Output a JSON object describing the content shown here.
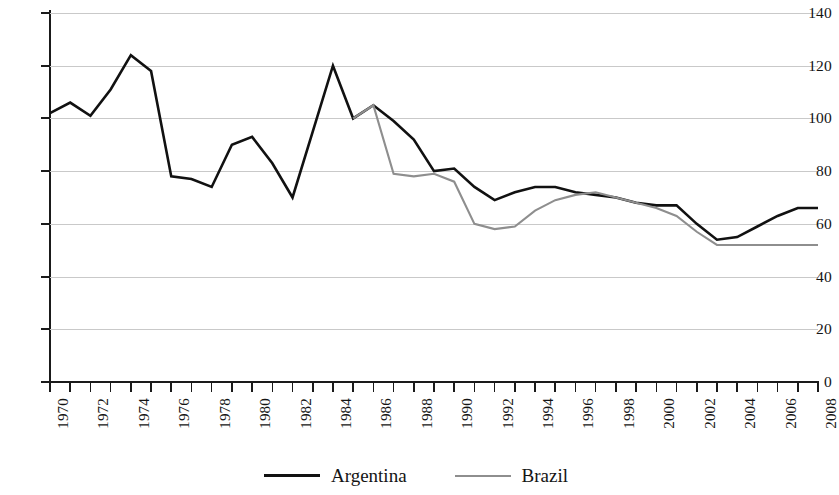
{
  "chart_data": {
    "type": "line",
    "title": "",
    "subtitle": "",
    "xlabel": "",
    "ylabel": "",
    "xlim": [
      1970,
      2008
    ],
    "ylim": [
      0,
      140
    ],
    "grid": true,
    "legend_position": "bottom-center",
    "y_ticks": [
      0,
      20,
      40,
      60,
      80,
      100,
      120,
      140
    ],
    "y_tick_labels": [
      "0",
      "20",
      "40",
      "60",
      "80",
      "100",
      "120",
      "140"
    ],
    "x_ticks": [
      1970,
      1971,
      1972,
      1973,
      1974,
      1975,
      1976,
      1977,
      1978,
      1979,
      1980,
      1981,
      1982,
      1983,
      1984,
      1985,
      1986,
      1987,
      1988,
      1989,
      1990,
      1991,
      1992,
      1993,
      1994,
      1995,
      1996,
      1997,
      1998,
      1999,
      2000,
      2001,
      2002,
      2003,
      2004,
      2005,
      2006,
      2007,
      2008
    ],
    "x_tick_labels": [
      "1970",
      "1972",
      "1974",
      "1976",
      "1978",
      "1980",
      "1982",
      "1984",
      "1986",
      "1988",
      "1990",
      "1992",
      "1994",
      "1996",
      "1998",
      "2000",
      "2002",
      "2004",
      "2006",
      "2008"
    ],
    "x_tick_label_years": [
      1970,
      1972,
      1974,
      1976,
      1978,
      1980,
      1982,
      1984,
      1986,
      1988,
      1990,
      1992,
      1994,
      1996,
      1998,
      2000,
      2002,
      2004,
      2006,
      2008
    ],
    "x_tick_label_rotation": -90,
    "series": [
      {
        "name": "Argentina",
        "color": "#111111",
        "x": [
          1970,
          1971,
          1972,
          1973,
          1974,
          1975,
          1976,
          1977,
          1978,
          1979,
          1980,
          1981,
          1982,
          1983,
          1984,
          1985,
          1986,
          1987,
          1988,
          1989,
          1990,
          1991,
          1992,
          1993,
          1994,
          1995,
          1996,
          1997,
          1998,
          1999,
          2000,
          2001,
          2002,
          2003,
          2004,
          2005,
          2006,
          2007,
          2008
        ],
        "values": [
          102,
          106,
          101,
          111,
          124,
          118,
          78,
          77,
          74,
          90,
          93,
          83,
          70,
          95,
          120,
          100,
          105,
          99,
          92,
          80,
          81,
          74,
          69,
          72,
          74,
          74,
          72,
          71,
          70,
          68,
          67,
          67,
          60,
          54,
          55,
          59,
          63,
          66,
          66
        ]
      },
      {
        "name": "Brazil",
        "color": "#8e8e8e",
        "x": [
          1985,
          1986,
          1987,
          1988,
          1989,
          1990,
          1991,
          1992,
          1993,
          1994,
          1995,
          1996,
          1997,
          1998,
          1999,
          2000,
          2001,
          2002,
          2003,
          2004,
          2005,
          2006,
          2007,
          2008
        ],
        "values": [
          100,
          105,
          79,
          78,
          79,
          76,
          60,
          58,
          59,
          65,
          69,
          71,
          72,
          70,
          68,
          66,
          63,
          57,
          52,
          52,
          52,
          52,
          52,
          52
        ]
      }
    ]
  },
  "legend": {
    "items": [
      {
        "label": "Argentina",
        "swatch": "solid-black-line"
      },
      {
        "label": "Brazil",
        "swatch": "solid-gray-line"
      }
    ]
  }
}
